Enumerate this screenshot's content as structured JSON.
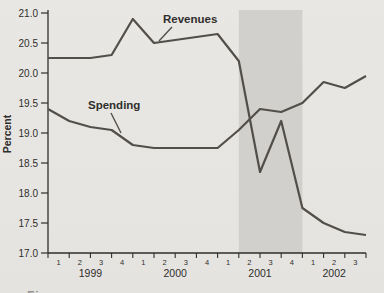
{
  "figure": {
    "y_axis_label": "Percent",
    "caption_sliver": "Figure"
  },
  "chart_data": {
    "type": "line",
    "title": "",
    "xlabel": "",
    "ylabel": "Percent",
    "ylim": [
      17.0,
      21.0
    ],
    "grid": false,
    "legend_position": "inline-labels",
    "y_tick_labels": [
      "21.0",
      "20.5",
      "20.0",
      "19.5",
      "19.0",
      "18.5",
      "18.0",
      "17.5",
      "17.0"
    ],
    "quarter_tick_labels": [
      "1",
      "2",
      "3",
      "4",
      "1",
      "2",
      "3",
      "4",
      "1",
      "2",
      "3",
      "4",
      "1",
      "2",
      "3"
    ],
    "year_labels": [
      {
        "label": "1999",
        "center_boundary_index": 2
      },
      {
        "label": "2000",
        "center_boundary_index": 6
      },
      {
        "label": "2001",
        "center_boundary_index": 10
      },
      {
        "label": "2002",
        "center_boundary_index": 13.5
      }
    ],
    "x_points_note": "16 points at quarter boundaries, from start of 1999Q1 through end of 2002Q3",
    "series": [
      {
        "name": "Revenues",
        "values": [
          20.25,
          20.25,
          20.25,
          20.3,
          20.9,
          20.5,
          20.55,
          20.6,
          20.65,
          20.2,
          18.35,
          19.2,
          17.75,
          17.5,
          17.35,
          17.3
        ]
      },
      {
        "name": "Spending",
        "values": [
          19.4,
          19.2,
          19.1,
          19.05,
          18.8,
          18.75,
          18.75,
          18.75,
          18.75,
          19.05,
          19.4,
          19.35,
          19.5,
          19.85,
          19.75,
          19.95
        ]
      }
    ],
    "recession_band_boundary_indexes": [
      9,
      12
    ],
    "colors": {
      "line": "#524f4a",
      "band": "#d2d0cc",
      "background": "#e8e6e3",
      "text": "#2f2e2c"
    }
  }
}
